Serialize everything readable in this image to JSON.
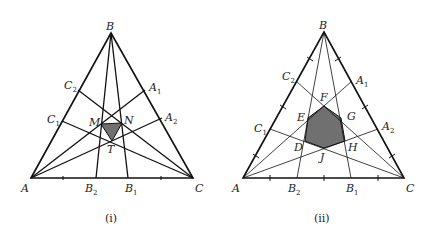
{
  "figures": [
    {
      "id": "i",
      "caption": "(i)",
      "vertices": {
        "A": "A",
        "B": "B",
        "C": "C"
      },
      "side_points": {
        "C2": {
          "base": "C",
          "sub": "2"
        },
        "C1": {
          "base": "C",
          "sub": "1"
        },
        "A1": {
          "base": "A",
          "sub": "1"
        },
        "A2": {
          "base": "A",
          "sub": "2"
        },
        "B2": {
          "base": "B",
          "sub": "2"
        },
        "B1": {
          "base": "B",
          "sub": "1"
        }
      },
      "interior_points": {
        "M": "M",
        "N": "N",
        "T": "T"
      },
      "shaded_region": "triangle MNT",
      "shade_color": "#707070"
    },
    {
      "id": "ii",
      "caption": "(ii)",
      "vertices": {
        "A": "A",
        "B": "B",
        "C": "C"
      },
      "side_points": {
        "C2": {
          "base": "C",
          "sub": "2"
        },
        "C1": {
          "base": "C",
          "sub": "1"
        },
        "A1": {
          "base": "A",
          "sub": "1"
        },
        "A2": {
          "base": "A",
          "sub": "2"
        },
        "B2": {
          "base": "B",
          "sub": "2"
        },
        "B1": {
          "base": "B",
          "sub": "1"
        }
      },
      "interior_points": {
        "D": "D",
        "E": "E",
        "F": "F",
        "G": "G",
        "H": "H",
        "J": "J"
      },
      "shaded_region": "hexagon DEFGHJ",
      "shade_color": "#707070"
    }
  ],
  "colors": {
    "stroke": "#111111",
    "shade": "#707070",
    "background": "#ffffff"
  }
}
